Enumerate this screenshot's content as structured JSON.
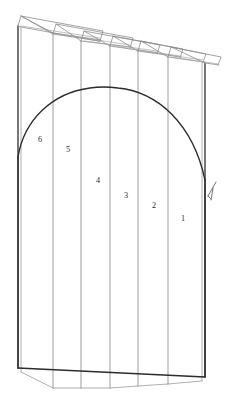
{
  "figure": {
    "type": "line-drawing",
    "background_color": "#ffffff",
    "line_color_light": "#8d8d8d",
    "line_color_medium": "#6b6b6b",
    "line_color_heavy": "#2b2b2b",
    "canvas": {
      "width": 234,
      "height": 404
    }
  },
  "panels": [
    {
      "label": "1",
      "label_x": 183,
      "label_y": 219,
      "front_edge_x": 168,
      "back_edge_x": 205,
      "top_y": 57,
      "bottom_y": 379
    },
    {
      "label": "2",
      "label_x": 154,
      "label_y": 206,
      "front_edge_x": 138,
      "back_edge_x": 168,
      "top_y": 50,
      "bottom_y": 374
    },
    {
      "label": "3",
      "label_x": 126,
      "label_y": 196,
      "front_edge_x": 110,
      "back_edge_x": 138,
      "top_y": 45,
      "bottom_y": 386
    },
    {
      "label": "4",
      "label_x": 98,
      "label_y": 181,
      "front_edge_x": 81,
      "back_edge_x": 110,
      "top_y": 40,
      "bottom_y": 388
    },
    {
      "label": "5",
      "label_x": 68,
      "label_y": 150,
      "front_edge_x": 53,
      "back_edge_x": 81,
      "top_y": 33,
      "bottom_y": 388
    },
    {
      "label": "6",
      "label_x": 40,
      "label_y": 140,
      "front_edge_x": 18,
      "back_edge_x": 53,
      "top_y": 24,
      "bottom_y": 375
    }
  ],
  "arch": {
    "name": "arched-profile-outline",
    "left_spring_x": 18,
    "left_spring_y": 157,
    "apex_x": 115,
    "apex_y": 88,
    "right_spring_x": 205,
    "right_spring_y": 180
  },
  "base": {
    "name": "base-outline",
    "left_x": 18,
    "left_y": 368,
    "right_x": 205,
    "right_y": 377
  },
  "leader_mark": {
    "name": "leader-tick-mark",
    "x": 210,
    "y": 192,
    "description": "small sketched tick/leader mark at right of arch spring"
  },
  "annotations": {
    "numbering_order": "right-to-left, 1 through 6",
    "count": 6
  }
}
